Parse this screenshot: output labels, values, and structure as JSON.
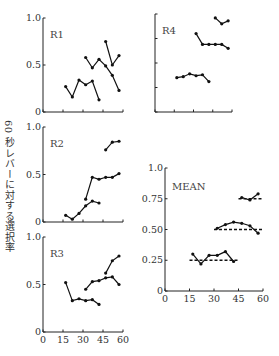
{
  "header_caption": "",
  "footer_caption": "",
  "y_axis_label": "60 秒レバーに対する選択率",
  "chart_data": [
    {
      "type": "line",
      "title": "R1",
      "xlabel": "",
      "ylabel": "60 秒レバーに対する選択率",
      "xlim": [
        0,
        60
      ],
      "ylim": [
        0,
        1.0
      ],
      "x_ticks": [
        0,
        15,
        30,
        45,
        60
      ],
      "y_ticks": [
        0,
        0.5,
        1.0
      ],
      "y_tick_labels": [
        "0",
        "0.5",
        "1.0"
      ],
      "series": [
        {
          "name": "seg1",
          "x": [
            17,
            22,
            27,
            32,
            37,
            42
          ],
          "y": [
            0.27,
            0.16,
            0.34,
            0.29,
            0.33,
            0.13
          ]
        },
        {
          "name": "seg2",
          "x": [
            32,
            37,
            42,
            47,
            52,
            57
          ],
          "y": [
            0.58,
            0.47,
            0.56,
            0.49,
            0.39,
            0.23
          ]
        },
        {
          "name": "seg3",
          "x": [
            47,
            52,
            57
          ],
          "y": [
            0.75,
            0.5,
            0.6
          ]
        }
      ]
    },
    {
      "type": "line",
      "title": "R4",
      "xlim": [
        0,
        60
      ],
      "ylim": [
        0,
        1.0
      ],
      "x_ticks": [
        0,
        15,
        30,
        45,
        60
      ],
      "y_ticks": [
        0,
        0.25,
        0.5,
        0.75,
        1.0
      ],
      "series": [
        {
          "name": "seg1",
          "x": [
            17,
            22,
            27,
            32,
            37,
            42
          ],
          "y": [
            0.35,
            0.36,
            0.39,
            0.37,
            0.38,
            0.31
          ]
        },
        {
          "name": "seg2",
          "x": [
            32,
            37,
            42,
            47,
            52,
            57
          ],
          "y": [
            0.8,
            0.69,
            0.69,
            0.69,
            0.69,
            0.65
          ]
        },
        {
          "name": "seg3",
          "x": [
            47,
            52,
            57
          ],
          "y": [
            0.96,
            0.9,
            0.93
          ]
        }
      ]
    },
    {
      "type": "line",
      "title": "R2",
      "xlim": [
        0,
        60
      ],
      "ylim": [
        0,
        1.0
      ],
      "x_ticks": [
        0,
        15,
        30,
        45,
        60
      ],
      "y_ticks": [
        0,
        0.5,
        1.0
      ],
      "y_tick_labels": [
        "0",
        "0.5",
        "1.0"
      ],
      "series": [
        {
          "name": "seg1",
          "x": [
            17,
            22,
            27,
            32,
            37,
            42
          ],
          "y": [
            0.07,
            0.03,
            0.09,
            0.17,
            0.22,
            0.2
          ]
        },
        {
          "name": "seg2",
          "x": [
            32,
            37,
            42,
            47,
            52,
            57
          ],
          "y": [
            0.24,
            0.47,
            0.45,
            0.47,
            0.47,
            0.51
          ]
        },
        {
          "name": "seg3",
          "x": [
            47,
            52,
            57
          ],
          "y": [
            0.76,
            0.84,
            0.85
          ]
        }
      ]
    },
    {
      "type": "line",
      "title": "MEAN",
      "xlim": [
        0,
        60
      ],
      "ylim": [
        0,
        1.0
      ],
      "x_ticks": [
        0,
        15,
        30,
        45,
        60
      ],
      "x_tick_labels": [
        "0",
        "15",
        "30",
        "45",
        "60"
      ],
      "y_ticks": [
        0,
        0.25,
        0.5,
        0.75,
        1.0
      ],
      "y_tick_labels": [
        "0",
        "0.25",
        "0.50",
        "0.75",
        "1.0"
      ],
      "series": [
        {
          "name": "seg1",
          "x": [
            17,
            22,
            27,
            32,
            37,
            42
          ],
          "y": [
            0.3,
            0.22,
            0.29,
            0.29,
            0.32,
            0.24
          ]
        },
        {
          "name": "seg2",
          "x": [
            32,
            37,
            42,
            47,
            52,
            57
          ],
          "y": [
            0.51,
            0.54,
            0.56,
            0.55,
            0.53,
            0.47
          ]
        },
        {
          "name": "seg3",
          "x": [
            47,
            52,
            57
          ],
          "y": [
            0.76,
            0.74,
            0.79
          ]
        }
      ],
      "reference_lines": [
        {
          "y": 0.25,
          "x_from": 15,
          "x_to": 45,
          "style": "dashed"
        },
        {
          "y": 0.5,
          "x_from": 30,
          "x_to": 60,
          "style": "dashed"
        },
        {
          "y": 0.75,
          "x_from": 45,
          "x_to": 60,
          "style": "dashed"
        }
      ]
    },
    {
      "type": "line",
      "title": "R3",
      "xlim": [
        0,
        60
      ],
      "ylim": [
        0,
        1.0
      ],
      "x_ticks": [
        0,
        15,
        30,
        45,
        60
      ],
      "x_tick_labels": [
        "0",
        "15",
        "30",
        "45",
        "60"
      ],
      "y_ticks": [
        0,
        0.5,
        1.0
      ],
      "y_tick_labels": [
        "0",
        "0.5",
        "1.0"
      ],
      "series": [
        {
          "name": "seg1",
          "x": [
            17,
            22,
            27,
            32,
            37,
            42
          ],
          "y": [
            0.52,
            0.33,
            0.35,
            0.33,
            0.34,
            0.29
          ]
        },
        {
          "name": "seg2",
          "x": [
            32,
            37,
            42,
            47,
            52,
            57
          ],
          "y": [
            0.45,
            0.53,
            0.54,
            0.57,
            0.58,
            0.5
          ]
        },
        {
          "name": "seg3",
          "x": [
            47,
            52,
            57
          ],
          "y": [
            0.62,
            0.75,
            0.8
          ]
        }
      ]
    }
  ],
  "panel_layout": [
    {
      "x0": 43,
      "x1": 123,
      "y0": 112,
      "y1": 18,
      "labelx": 50,
      "labely": 38,
      "show_ylabels": true,
      "show_xlabels": false
    },
    {
      "x0": 155,
      "x1": 232,
      "y0": 112,
      "y1": 14,
      "labelx": 162,
      "labely": 34,
      "show_ylabels": false,
      "show_xlabels": false
    },
    {
      "x0": 43,
      "x1": 123,
      "y0": 222,
      "y1": 127,
      "labelx": 50,
      "labely": 147,
      "show_ylabels": true,
      "show_xlabels": false
    },
    {
      "x0": 165,
      "x1": 263,
      "y0": 291,
      "y1": 168,
      "labelx": 172,
      "labely": 190,
      "show_ylabels": true,
      "show_xlabels": true
    },
    {
      "x0": 43,
      "x1": 123,
      "y0": 332,
      "y1": 237,
      "labelx": 50,
      "labely": 257,
      "show_ylabels": true,
      "show_xlabels": true
    }
  ]
}
